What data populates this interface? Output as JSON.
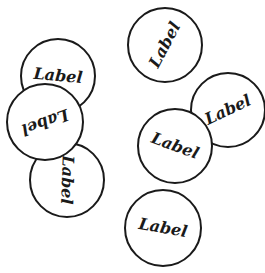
{
  "stage": {
    "background": "#ffffff",
    "stroke_color": "#1a1a1a"
  },
  "bubbles": [
    {
      "label": "Label",
      "cx": 165,
      "cy": 45,
      "r": 36,
      "rotation": -62,
      "z": 1
    },
    {
      "label": "Label",
      "cx": 228,
      "cy": 110,
      "r": 36,
      "rotation": -25,
      "z": 1
    },
    {
      "label": "Label",
      "cx": 175,
      "cy": 146,
      "r": 36,
      "rotation": 20,
      "z": 2
    },
    {
      "label": "Label",
      "cx": 67,
      "cy": 180,
      "r": 36,
      "rotation": 92,
      "z": 1
    },
    {
      "label": "Label",
      "cx": 58,
      "cy": 76,
      "r": 36,
      "rotation": 5,
      "z": 2
    },
    {
      "label": "Label",
      "cx": 45,
      "cy": 122,
      "r": 37,
      "rotation": 160,
      "z": 3
    },
    {
      "label": "Label",
      "cx": 163,
      "cy": 228,
      "r": 37,
      "rotation": 10,
      "z": 1
    }
  ]
}
